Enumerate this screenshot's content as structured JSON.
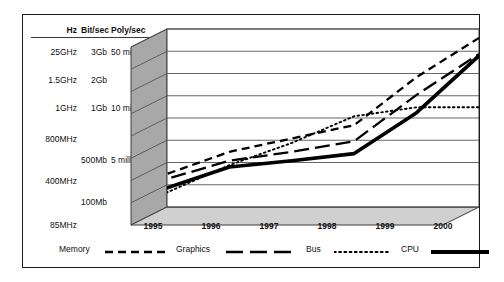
{
  "figure": {
    "background": "#ffffff",
    "border_color": "#1a1a1a",
    "wall_color": "#a8a8a8",
    "floor_color": "#d0d0d0",
    "grid_color": "#555555"
  },
  "scale_table": {
    "headers": {
      "hz": "Hz",
      "bitsec": "Bit/sec",
      "polysec": "Poly/sec"
    },
    "rows": [
      {
        "hz": "25GHz",
        "bitsec": "3Gb",
        "polysec": "50 million"
      },
      {
        "hz": "1.5GHz",
        "bitsec": "2Gb",
        "polysec": ""
      },
      {
        "hz": "1GHz",
        "bitsec": "1Gb",
        "polysec": "10 million"
      },
      {
        "hz": "800MHz",
        "bitsec": "",
        "polysec": ""
      },
      {
        "hz": "",
        "bitsec": "500Mb",
        "polysec": "5 million"
      },
      {
        "hz": "400MHz",
        "bitsec": "",
        "polysec": ""
      },
      {
        "hz": "",
        "bitsec": "100Mb",
        "polysec": ""
      },
      {
        "hz": "85MHz",
        "bitsec": "",
        "polysec": ""
      }
    ]
  },
  "chart_data": {
    "type": "line",
    "title": "",
    "xlabel": "",
    "ylabel": "",
    "grid": true,
    "legend_position": "bottom",
    "categories": [
      "1995",
      "1996",
      "1997",
      "1998",
      "1999",
      "2000"
    ],
    "x": [
      1995,
      1996,
      1997,
      1998,
      1999,
      2000
    ],
    "ylim": [
      0,
      10
    ],
    "y_axis_labels": [
      "85MHz",
      "100Mb",
      "400MHz",
      "5 million",
      "500Mb",
      "800MHz",
      "10 million",
      "1GHz",
      "1Gb",
      "2Gb",
      "1.5GHz",
      "50 million",
      "3Gb",
      "25GHz"
    ],
    "series": [
      {
        "name": "Memory",
        "style": "dashed",
        "values": [
          2.15,
          3.1,
          3.85,
          4.6,
          7.3,
          9.5
        ]
      },
      {
        "name": "Graphics",
        "style": "long-dash",
        "values": [
          2.0,
          2.6,
          3.1,
          3.7,
          6.3,
          8.6
        ]
      },
      {
        "name": "Bus",
        "style": "dotted",
        "values": [
          0.95,
          2.35,
          3.6,
          5.1,
          5.6,
          5.6
        ]
      },
      {
        "name": "CPU",
        "style": "thick-solid",
        "values": [
          1.4,
          2.25,
          2.6,
          3.0,
          5.3,
          8.5
        ]
      }
    ]
  },
  "legend": {
    "items": [
      {
        "label": "Memory",
        "style": "dashed"
      },
      {
        "label": "Graphics",
        "style": "long-dash"
      },
      {
        "label": "Bus",
        "style": "dotted"
      },
      {
        "label": "CPU",
        "style": "thick-solid"
      }
    ]
  }
}
